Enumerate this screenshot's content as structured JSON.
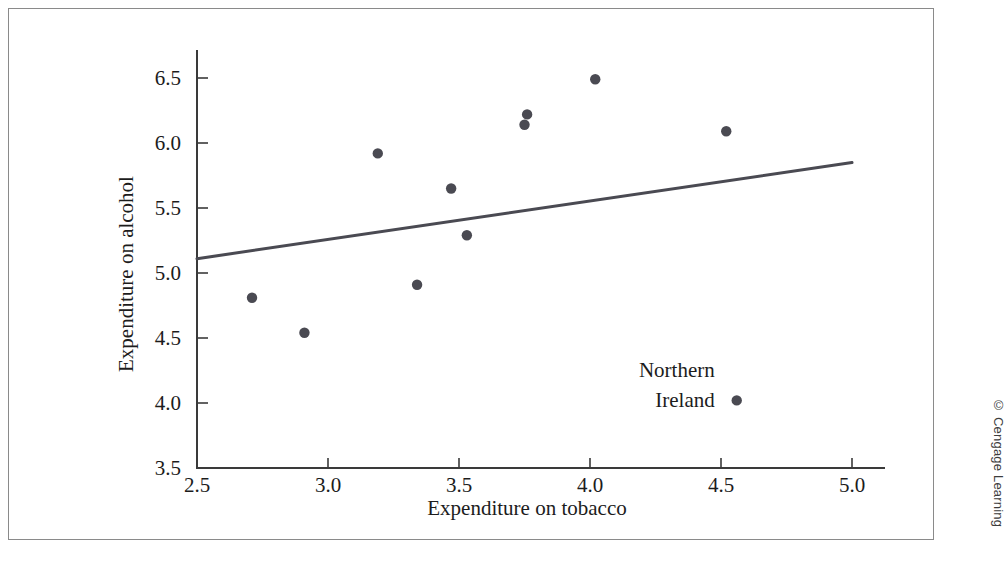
{
  "figure": {
    "credit": "© Cengage Learning"
  },
  "chart_data": {
    "type": "scatter",
    "title": "",
    "xlabel": "Expenditure on tobacco",
    "ylabel": "Expenditure on alcohol",
    "xlim": [
      2.5,
      5.0
    ],
    "ylim": [
      3.5,
      6.5
    ],
    "xticks": [
      "2.5",
      "3.0",
      "3.5",
      "4.0",
      "4.5",
      "5.0"
    ],
    "xtick_values": [
      2.5,
      3.0,
      3.5,
      4.0,
      4.5,
      5.0
    ],
    "yticks": [
      "3.5",
      "4.0",
      "4.5",
      "5.0",
      "5.5",
      "6.0",
      "6.5"
    ],
    "ytick_values": [
      3.5,
      4.0,
      4.5,
      5.0,
      5.5,
      6.0,
      6.5
    ],
    "grid": false,
    "legend": null,
    "points": [
      {
        "x": 2.71,
        "y": 4.81
      },
      {
        "x": 2.91,
        "y": 4.54
      },
      {
        "x": 3.19,
        "y": 5.92
      },
      {
        "x": 3.34,
        "y": 4.91
      },
      {
        "x": 3.47,
        "y": 5.65
      },
      {
        "x": 3.53,
        "y": 5.29
      },
      {
        "x": 3.75,
        "y": 6.14
      },
      {
        "x": 3.76,
        "y": 6.22
      },
      {
        "x": 4.02,
        "y": 6.49
      },
      {
        "x": 4.52,
        "y": 6.09
      },
      {
        "x": 4.56,
        "y": 4.02
      }
    ],
    "fit_line": {
      "x0": 2.5,
      "y0": 5.11,
      "x1": 5.0,
      "y1": 5.85
    },
    "annotations": [
      {
        "label_line1": "Northern",
        "label_line2": "Ireland",
        "x": 4.56,
        "y": 4.02
      }
    ]
  }
}
